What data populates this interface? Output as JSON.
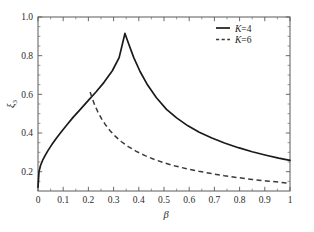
{
  "chart_data": {
    "type": "line",
    "title": "",
    "subtitle": "",
    "xlabel": "β",
    "ylabel": "ξ",
    "ylabel_subscript": "3",
    "xlim": [
      0,
      1
    ],
    "ylim": [
      0.1,
      1.0
    ],
    "grid": false,
    "legend_position": "top-right",
    "xticks": [
      0,
      0.1,
      0.2,
      0.3,
      0.4,
      0.5,
      0.6,
      0.7,
      0.8,
      0.9,
      1
    ],
    "xticklabels": [
      "0",
      "0.1",
      "0.2",
      "0.3",
      "0.4",
      "0.5",
      "0.6",
      "0.7",
      "0.8",
      "0.9",
      "1"
    ],
    "yticks": [
      0.2,
      0.4,
      0.6,
      0.8,
      1.0
    ],
    "yticklabels": [
      "0.2",
      "0.4",
      "0.6",
      "0.8",
      "1.0"
    ],
    "xminor_step": 0.05,
    "yminor_step": 0.05,
    "series": [
      {
        "name": "K=4",
        "style": "solid",
        "color": "#1a1a1a",
        "peak": {
          "x": 0.345,
          "y": 0.915
        },
        "x": [
          0.0,
          0.004,
          0.01,
          0.018,
          0.028,
          0.04,
          0.055,
          0.072,
          0.092,
          0.115,
          0.14,
          0.168,
          0.198,
          0.23,
          0.262,
          0.295,
          0.322,
          0.345,
          0.36,
          0.38,
          0.405,
          0.435,
          0.47,
          0.51,
          0.55,
          0.595,
          0.64,
          0.69,
          0.74,
          0.795,
          0.85,
          0.905,
          0.955,
          1.0
        ],
        "y": [
          0.12,
          0.2,
          0.232,
          0.258,
          0.283,
          0.31,
          0.34,
          0.372,
          0.405,
          0.443,
          0.482,
          0.522,
          0.566,
          0.612,
          0.662,
          0.722,
          0.79,
          0.915,
          0.86,
          0.79,
          0.718,
          0.648,
          0.582,
          0.522,
          0.478,
          0.437,
          0.404,
          0.374,
          0.348,
          0.324,
          0.303,
          0.285,
          0.27,
          0.258
        ]
      },
      {
        "name": "K=6",
        "style": "dashed",
        "color": "#3a3a3a",
        "peak": {
          "x": 0.207,
          "y": 0.612
        },
        "x": [
          0.207,
          0.215,
          0.225,
          0.238,
          0.252,
          0.268,
          0.286,
          0.306,
          0.33,
          0.358,
          0.39,
          0.425,
          0.462,
          0.502,
          0.545,
          0.59,
          0.638,
          0.688,
          0.74,
          0.795,
          0.85,
          0.905,
          0.955,
          1.0
        ],
        "y": [
          0.612,
          0.58,
          0.545,
          0.508,
          0.474,
          0.442,
          0.412,
          0.384,
          0.356,
          0.33,
          0.305,
          0.283,
          0.263,
          0.245,
          0.229,
          0.215,
          0.202,
          0.19,
          0.179,
          0.169,
          0.16,
          0.152,
          0.146,
          0.14
        ]
      }
    ],
    "legend_entries": [
      {
        "label": "K=4",
        "style": "solid"
      },
      {
        "label": "K=6",
        "style": "dashed"
      }
    ],
    "annotations": []
  },
  "plot_geometry": {
    "left": 38,
    "right": 290,
    "top": 17,
    "bottom": 191
  }
}
